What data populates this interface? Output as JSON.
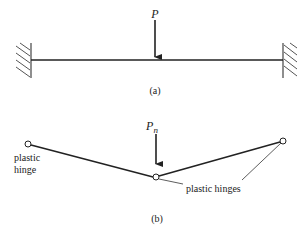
{
  "figure_a": {
    "load_label": "P",
    "caption": "(a)"
  },
  "figure_b": {
    "load_label_base": "P",
    "load_label_sub": "n",
    "left_hinge_label_line1": "plastic",
    "left_hinge_label_line2": "hinge",
    "hinges_label": "plastic hinges",
    "caption": "(b)"
  },
  "colors": {
    "ink": "#222222",
    "hatch": "#555555"
  }
}
